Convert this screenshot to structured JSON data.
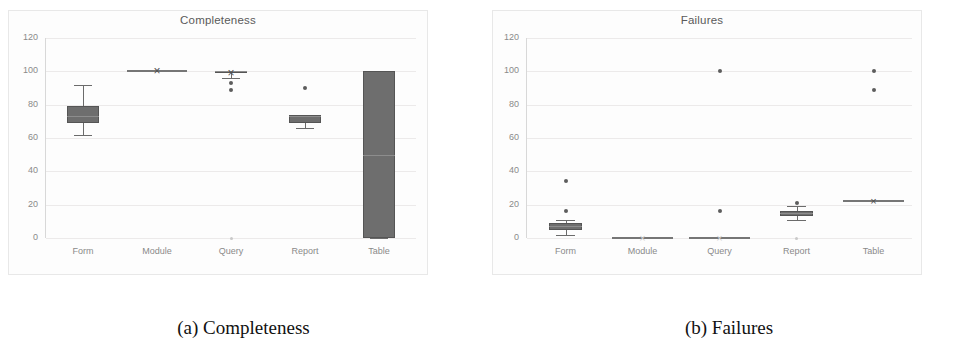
{
  "figure": {
    "caption_a": "(a) Completeness",
    "caption_b": "(b) Failures"
  },
  "chart_data": [
    {
      "type": "box",
      "title": "Completeness",
      "xlabel": "",
      "ylabel": "",
      "ylim": [
        0,
        120
      ],
      "yticks": [
        0,
        20,
        40,
        60,
        80,
        100,
        120
      ],
      "grid": true,
      "legend": "none",
      "categories": [
        "Form",
        "Module",
        "Query",
        "Report",
        "Table"
      ],
      "boxes": [
        {
          "category": "Form",
          "whisker_low": 62,
          "q1": 69,
          "median": 73,
          "q3": 79,
          "whisker_high": 92,
          "mean": 74,
          "outliers": []
        },
        {
          "category": "Module",
          "whisker_low": 100,
          "q1": 100,
          "median": 100,
          "q3": 100,
          "whisker_high": 100,
          "mean": 100,
          "outliers": []
        },
        {
          "category": "Query",
          "whisker_low": 96,
          "q1": 100,
          "median": 100,
          "q3": 100,
          "whisker_high": 100,
          "mean": 99,
          "outliers": [
            93,
            89,
            0
          ]
        },
        {
          "category": "Report",
          "whisker_low": 66,
          "q1": 69,
          "median": 73,
          "q3": 74,
          "whisker_high": 74,
          "mean": 71,
          "outliers": [
            90
          ]
        },
        {
          "category": "Table",
          "whisker_low": 0,
          "q1": 0,
          "median": 50,
          "q3": 100,
          "whisker_high": 100,
          "mean": 50,
          "outliers": []
        }
      ]
    },
    {
      "type": "box",
      "title": "Failures",
      "xlabel": "",
      "ylabel": "",
      "ylim": [
        0,
        120
      ],
      "yticks": [
        0,
        20,
        40,
        60,
        80,
        100,
        120
      ],
      "grid": true,
      "legend": "none",
      "categories": [
        "Form",
        "Module",
        "Query",
        "Report",
        "Table"
      ],
      "boxes": [
        {
          "category": "Form",
          "whisker_low": 2,
          "q1": 5,
          "median": 7,
          "q3": 9,
          "whisker_high": 11,
          "mean": 8,
          "outliers": [
            16,
            34
          ]
        },
        {
          "category": "Module",
          "whisker_low": 0,
          "q1": 0,
          "median": 0,
          "q3": 0,
          "whisker_high": 0,
          "mean": 0,
          "outliers": []
        },
        {
          "category": "Query",
          "whisker_low": 0,
          "q1": 0,
          "median": 0,
          "q3": 0,
          "whisker_high": 0,
          "mean": 0,
          "outliers": [
            16,
            100
          ]
        },
        {
          "category": "Report",
          "whisker_low": 11,
          "q1": 13,
          "median": 15,
          "q3": 16,
          "whisker_high": 19,
          "mean": 15,
          "outliers": [
            21,
            0
          ]
        },
        {
          "category": "Table",
          "whisker_low": 22,
          "q1": 22,
          "median": 22,
          "q3": 22,
          "whisker_high": 22,
          "mean": 22,
          "outliers": [
            100,
            89
          ]
        }
      ]
    }
  ],
  "colors": {
    "box_fill": "#6e6e6e",
    "box_edge": "#555555",
    "grid": "#eceaea",
    "tick_text": "#8a8a8a",
    "title_text": "#5a5a5a",
    "panel_bg": "#fdfdfd",
    "page_bg": "#ffffff"
  }
}
